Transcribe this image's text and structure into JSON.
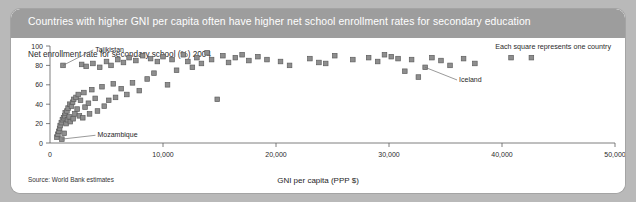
{
  "figure": {
    "title": "Countries with higher GNI per capita often have higher net school enrollment rates for secondary education",
    "legend_note": "Each square represents one country",
    "source": "Source: World Bank estimates",
    "colors": {
      "header_band": "#9d9d9d",
      "page_background": "#b9b9b9",
      "plot_background": "#ffffff",
      "marker_fill": "#8e8e8e",
      "marker_stroke": "#5e5e5e",
      "axis": "#5d5d5d"
    }
  },
  "chart_data": {
    "type": "scatter",
    "title": "Countries with higher GNI per capita often have higher net school enrollment rates for secondary education",
    "subtitle": "Net enrollment rate for secondary school (%) 2004",
    "xlabel": "GNI per capita (PPP $)",
    "ylabel": "Net enrollment rate for secondary school (%) 2004",
    "xlim": [
      0,
      50000
    ],
    "ylim": [
      0,
      100
    ],
    "xticks": [
      0,
      10000,
      20000,
      30000,
      40000,
      50000
    ],
    "xticklabels": [
      "0",
      "10,000",
      "20,000",
      "30,000",
      "40,000",
      "50,000"
    ],
    "yticks": [
      0,
      20,
      40,
      60,
      80,
      100
    ],
    "yticklabels": [
      "0",
      "20",
      "40",
      "60",
      "80",
      "100"
    ],
    "grid": false,
    "legend": "Each square represents one country",
    "legend_position": "top-right",
    "marker": "square",
    "annotations": [
      {
        "label": "Tajikistan",
        "x": 1150,
        "y": 80,
        "text_x": 4000,
        "text_y": 97
      },
      {
        "label": "Mozambique",
        "x": 1050,
        "y": 4,
        "text_x": 4200,
        "text_y": 9
      },
      {
        "label": "Iceland",
        "x": 33200,
        "y": 78,
        "text_x": 36200,
        "text_y": 66
      }
    ],
    "points": [
      [
        600,
        6
      ],
      [
        700,
        9
      ],
      [
        780,
        12
      ],
      [
        850,
        15
      ],
      [
        900,
        18
      ],
      [
        1000,
        21
      ],
      [
        1050,
        4
      ],
      [
        1100,
        24
      ],
      [
        1150,
        80
      ],
      [
        1200,
        26
      ],
      [
        1250,
        10
      ],
      [
        1300,
        28
      ],
      [
        1350,
        31
      ],
      [
        1420,
        20
      ],
      [
        1500,
        33
      ],
      [
        1550,
        24
      ],
      [
        1600,
        36
      ],
      [
        1700,
        27
      ],
      [
        1750,
        40
      ],
      [
        1800,
        22
      ],
      [
        1900,
        38
      ],
      [
        2000,
        42
      ],
      [
        2050,
        25
      ],
      [
        2100,
        45
      ],
      [
        2200,
        30
      ],
      [
        2300,
        47
      ],
      [
        2400,
        35
      ],
      [
        2500,
        50
      ],
      [
        2600,
        28
      ],
      [
        2700,
        44
      ],
      [
        2800,
        81
      ],
      [
        2900,
        26
      ],
      [
        3000,
        52
      ],
      [
        3100,
        37
      ],
      [
        3200,
        79
      ],
      [
        3400,
        41
      ],
      [
        3500,
        30
      ],
      [
        3700,
        55
      ],
      [
        3800,
        82
      ],
      [
        4000,
        46
      ],
      [
        4200,
        33
      ],
      [
        4400,
        78
      ],
      [
        4600,
        58
      ],
      [
        4800,
        38
      ],
      [
        5000,
        84
      ],
      [
        5200,
        44
      ],
      [
        5400,
        80
      ],
      [
        5600,
        61
      ],
      [
        5800,
        47
      ],
      [
        6000,
        86
      ],
      [
        6300,
        56
      ],
      [
        6500,
        83
      ],
      [
        6800,
        50
      ],
      [
        7000,
        88
      ],
      [
        7300,
        62
      ],
      [
        7600,
        85
      ],
      [
        7900,
        54
      ],
      [
        8200,
        90
      ],
      [
        8600,
        66
      ],
      [
        8900,
        87
      ],
      [
        9200,
        72
      ],
      [
        9500,
        84
      ],
      [
        10000,
        89
      ],
      [
        10400,
        60
      ],
      [
        10800,
        86
      ],
      [
        11200,
        75
      ],
      [
        11800,
        91
      ],
      [
        12200,
        84
      ],
      [
        12600,
        78
      ],
      [
        13000,
        88
      ],
      [
        13400,
        82
      ],
      [
        13900,
        93
      ],
      [
        14300,
        86
      ],
      [
        14800,
        45
      ],
      [
        15300,
        90
      ],
      [
        15800,
        83
      ],
      [
        16400,
        88
      ],
      [
        17000,
        91
      ],
      [
        17600,
        85
      ],
      [
        18400,
        89
      ],
      [
        19200,
        86
      ],
      [
        20400,
        84
      ],
      [
        21200,
        80
      ],
      [
        23000,
        87
      ],
      [
        23800,
        83
      ],
      [
        24400,
        82
      ],
      [
        25200,
        90
      ],
      [
        26800,
        86
      ],
      [
        28200,
        88
      ],
      [
        29000,
        84
      ],
      [
        29600,
        91
      ],
      [
        30200,
        89
      ],
      [
        30800,
        87
      ],
      [
        31400,
        74
      ],
      [
        32000,
        86
      ],
      [
        32600,
        68
      ],
      [
        33200,
        78
      ],
      [
        33800,
        88
      ],
      [
        34600,
        85
      ],
      [
        35400,
        80
      ],
      [
        36600,
        87
      ],
      [
        37600,
        82
      ],
      [
        40800,
        88
      ],
      [
        42600,
        88
      ]
    ]
  }
}
